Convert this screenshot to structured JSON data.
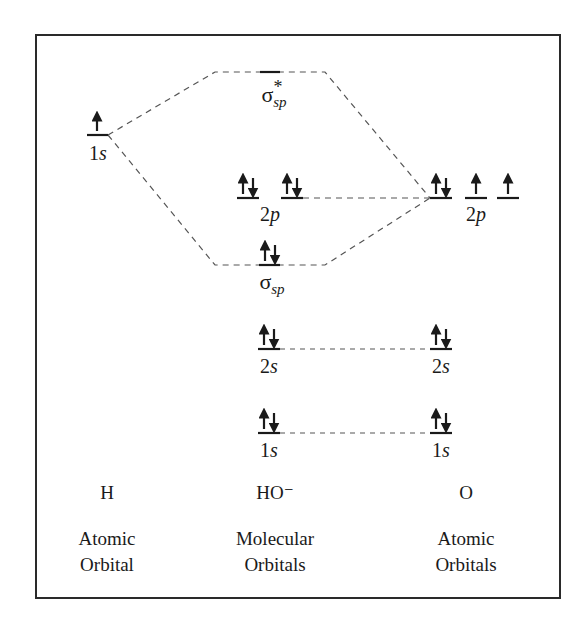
{
  "diagram": {
    "columns": {
      "left": {
        "species": "H",
        "caption_line1": "Atomic",
        "caption_line2": "Orbital"
      },
      "middle": {
        "species": "HO⁻",
        "caption_line1": "Molecular",
        "caption_line2": "Orbitals"
      },
      "right": {
        "species": "O",
        "caption_line1": "Atomic",
        "caption_line2": "Orbitals"
      }
    },
    "levels": {
      "h_1s": {
        "label_num": "1",
        "label_sub": "s",
        "electrons": "↑"
      },
      "mo_sigma_star": {
        "symbol": "σ",
        "sub": "sp",
        "sup": "*",
        "electrons": ""
      },
      "mo_2p": {
        "label_num": "2",
        "label_sub": "p",
        "electrons": [
          "↑↓",
          "↑↓"
        ]
      },
      "mo_sigma": {
        "symbol": "σ",
        "sub": "sp",
        "electrons": "↑↓"
      },
      "mo_2s": {
        "label_num": "2",
        "label_sub": "s",
        "electrons": "↑↓"
      },
      "mo_1s": {
        "label_num": "1",
        "label_sub": "s",
        "electrons": "↑↓"
      },
      "o_2p": {
        "label_num": "2",
        "label_sub": "p",
        "electrons": [
          "↑↓",
          "↑",
          "↑"
        ]
      },
      "o_2s": {
        "label_num": "2",
        "label_sub": "s",
        "electrons": "↑↓"
      },
      "o_1s": {
        "label_num": "1",
        "label_sub": "s",
        "electrons": "↑↓"
      }
    },
    "colors": {
      "line": "#1a1a1a",
      "dash": "#555555",
      "frame": "#2a2a2a"
    }
  }
}
